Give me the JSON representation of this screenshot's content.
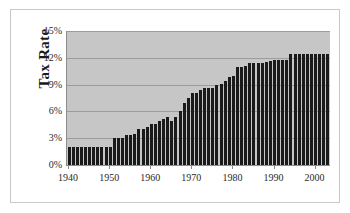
{
  "chart_data": {
    "type": "bar",
    "title": "",
    "xlabel": "",
    "ylabel": "Tax Rate",
    "ylim": [
      0,
      15
    ],
    "xlim": [
      1939.5,
      2003.5
    ],
    "grid": true,
    "legend": false,
    "y_tick_labels": [
      "0%",
      "3%",
      "6%",
      "9%",
      "12%",
      "15%"
    ],
    "y_tick_values": [
      0,
      3,
      6,
      9,
      12,
      15
    ],
    "x_tick_labels": [
      "1940",
      "1950",
      "1960",
      "1970",
      "1980",
      "1990",
      "2000"
    ],
    "x_tick_values": [
      1940,
      1950,
      1960,
      1970,
      1980,
      1990,
      2000
    ],
    "categories": [
      1940,
      1941,
      1942,
      1943,
      1944,
      1945,
      1946,
      1947,
      1948,
      1949,
      1950,
      1951,
      1952,
      1953,
      1954,
      1955,
      1956,
      1957,
      1958,
      1959,
      1960,
      1961,
      1962,
      1963,
      1964,
      1965,
      1966,
      1967,
      1968,
      1969,
      1970,
      1971,
      1972,
      1973,
      1974,
      1975,
      1976,
      1977,
      1978,
      1979,
      1980,
      1981,
      1982,
      1983,
      1984,
      1985,
      1986,
      1987,
      1988,
      1989,
      1990,
      1991,
      1992,
      1993,
      1994,
      1995,
      1996,
      1997,
      1998,
      1999,
      2000,
      2001,
      2002,
      2003
    ],
    "values": [
      2.0,
      2.0,
      2.0,
      2.0,
      2.0,
      2.0,
      2.0,
      2.0,
      2.0,
      2.0,
      2.0,
      3.0,
      3.0,
      3.0,
      4.0,
      4.0,
      4.0,
      4.5,
      4.5,
      5.0,
      6.0,
      6.0,
      6.25,
      7.25,
      7.25,
      7.25,
      8.4,
      8.8,
      8.8,
      9.6,
      9.6,
      10.4,
      10.4,
      11.7,
      11.7,
      11.7,
      11.7,
      11.7,
      12.1,
      12.26,
      12.26,
      13.3,
      13.4,
      13.4,
      14.0,
      14.1,
      14.3,
      14.3,
      15.02,
      15.02,
      15.3,
      15.3,
      15.3,
      15.3,
      15.3,
      15.3,
      15.3,
      15.3,
      15.3,
      15.3,
      15.3,
      15.3,
      15.3,
      15.3
    ],
    "plotted_values": [
      2.0,
      2.0,
      2.0,
      2.0,
      2.0,
      2.0,
      2.0,
      2.0,
      2.0,
      2.0,
      2.0,
      3.0,
      3.0,
      3.0,
      3.4,
      3.4,
      3.5,
      4.0,
      4.0,
      4.3,
      4.6,
      4.6,
      4.9,
      5.15,
      5.4,
      4.9,
      5.4,
      6.0,
      6.9,
      7.5,
      8.1,
      8.1,
      8.4,
      8.6,
      8.6,
      8.65,
      9.0,
      9.1,
      9.4,
      9.9,
      10.0,
      11.0,
      11.0,
      11.05,
      11.4,
      11.4,
      11.4,
      11.4,
      11.5,
      11.6,
      11.7,
      11.7,
      11.7,
      11.7,
      12.4,
      12.4,
      12.4,
      12.4,
      12.4,
      12.4,
      12.4,
      12.4,
      12.4,
      12.4
    ],
    "bar_color": "#1a1a1a",
    "plot_background": "#c6c6c6",
    "gridline_color": "#9c9c9c",
    "axis_color": "#8d8d8d",
    "figure_background": "#ffffff",
    "border_color": "#c9c9c9"
  }
}
